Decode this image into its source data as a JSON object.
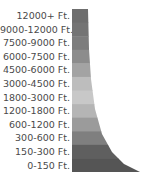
{
  "legend": {
    "title": "",
    "unit": "Ft.",
    "items": [
      {
        "label": "12000+ Ft.",
        "color": "#6e6e6e"
      },
      {
        "label": "9000-12000 Ft.",
        "color": "#747474"
      },
      {
        "label": "7500-9000 Ft.",
        "color": "#7d7d7d"
      },
      {
        "label": "6000-7500 Ft.",
        "color": "#8c8c8c"
      },
      {
        "label": "4500-6000 Ft.",
        "color": "#a3a3a3"
      },
      {
        "label": "3000-4500 Ft.",
        "color": "#bdbdbd"
      },
      {
        "label": "1800-3000 Ft.",
        "color": "#c8c8c8"
      },
      {
        "label": "1200-1800 Ft.",
        "color": "#b5b5b5"
      },
      {
        "label": "600-1200 Ft.",
        "color": "#9b9b9b"
      },
      {
        "label": "300-600 Ft.",
        "color": "#7f7f7f"
      },
      {
        "label": "150-300 Ft.",
        "color": "#5f5f5f"
      },
      {
        "label": "0-150 Ft.",
        "color": "#555555"
      }
    ]
  }
}
